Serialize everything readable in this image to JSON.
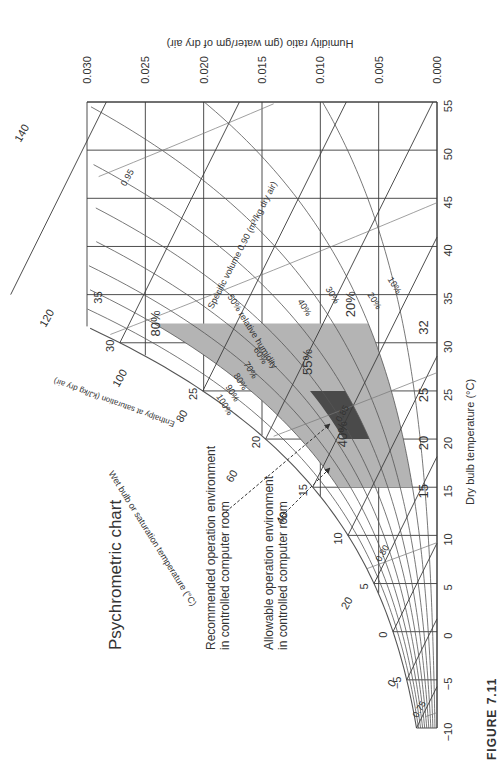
{
  "figure_label": "FIGURE 7.11",
  "chart_data": {
    "type": "psychrometric",
    "orientation": "rotated 90° counter-clockwise (dry bulb axis vertical on right, humidity ratio axis horizontal on top)",
    "title": "Psychrometric chart",
    "xlabel": "Dry bulb temperature (°C)",
    "ylabel": "Humidity ratio (gm water/gm of dry air)",
    "xlim": [
      -10,
      55
    ],
    "ylim": [
      0.0,
      0.03
    ],
    "x_ticks": [
      -10,
      -5,
      0,
      5,
      10,
      15,
      20,
      25,
      30,
      35,
      40,
      45,
      50,
      55
    ],
    "y_ticks": [
      "0.000",
      "0.005",
      "0.010",
      "0.015",
      "0.020",
      "0.025",
      "0.030"
    ],
    "grid": true,
    "relative_humidity_curves_pct": [
      10,
      20,
      30,
      40,
      50,
      60,
      70,
      80,
      90,
      100
    ],
    "rh_labels": [
      "10%",
      "20%",
      "30%",
      "40%",
      "50% relative humidity",
      "60%",
      "70%",
      "80%",
      "90%",
      "100%"
    ],
    "saturation_temperature_labels": [
      -5,
      0,
      5,
      10,
      15,
      20,
      25,
      30,
      35
    ],
    "saturation_axis_label": "Wet bulb or saturation temperature (°C)",
    "enthalpy_labels": [
      0,
      20,
      40,
      60,
      80,
      100,
      120,
      140
    ],
    "enthalpy_axis_label": "Enthalpy at saturation (kJ/kg dry air)",
    "specific_volume_labels": [
      "0.75",
      "0.80",
      "0.85",
      "0.90",
      "0.95"
    ],
    "specific_volume_axis_label": "Specific volume 0.90 (m³/kg dry air)",
    "regions": [
      {
        "name": "Allowable operation environment in controlled computer room",
        "shade": "#b4b4b4",
        "dry_bulb_range": [
          15,
          32
        ],
        "rh_range_pct": [
          20,
          80
        ],
        "labels": [
          "15",
          "32",
          "20%",
          "80%"
        ]
      },
      {
        "name": "Recommended operation environment in controlled computer room",
        "shade": "#4a4a4a",
        "dry_bulb_range": [
          20,
          25
        ],
        "rh_range_pct": [
          40,
          55
        ],
        "labels": [
          "20",
          "25",
          "40%",
          "55%"
        ]
      }
    ],
    "annotations": [
      "Recommended operation environment in controlled computer room",
      "Allowable operation environment in controlled computer room"
    ]
  },
  "notes": {
    "recommended_line1": "Recommended operation environment",
    "recommended_line2": "in controlled computer room",
    "allowable_line1": "Allowable operation environment",
    "allowable_line2": "in controlled computer room"
  },
  "colors": {
    "grid": "#3a3a3a",
    "curve": "#555555",
    "allowable_fill": "#b4b4b4",
    "recommended_fill": "#4a4a4a"
  }
}
